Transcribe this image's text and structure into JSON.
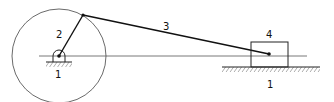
{
  "diagram": {
    "labels": {
      "crank": "2",
      "connecting_rod": "3",
      "slider": "4",
      "ground_crank": "1",
      "ground_slider": "1"
    },
    "colors": {
      "line": "#222222",
      "background": "#ffffff"
    }
  }
}
